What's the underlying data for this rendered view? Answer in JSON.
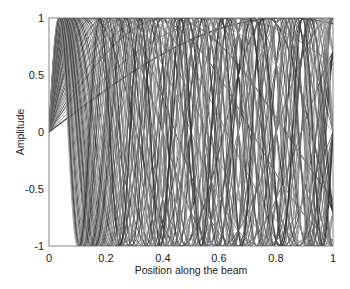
{
  "chart_data": {
    "type": "line",
    "title": "",
    "xlabel": "Position along the beam",
    "ylabel": "Amplitude",
    "xlim": [
      0,
      1
    ],
    "ylim": [
      -1,
      1
    ],
    "xticks": [
      "0",
      "0.2",
      "0.4",
      "0.6",
      "0.8",
      "1"
    ],
    "yticks": [
      "1",
      "0.5",
      "0",
      "-0.5",
      "-1"
    ],
    "grid": false,
    "legend": null,
    "series_form": "y = sin(w * x)",
    "frequencies": [
      1.2,
      1.6,
      2.0,
      2.4,
      2.8,
      3.2,
      3.6,
      4.0,
      4.5,
      5.0,
      5.5,
      6.0,
      6.5,
      7.0,
      7.5,
      8.0,
      8.5,
      9.0,
      9.5,
      10.0,
      10.5,
      11.0,
      11.5,
      12.0,
      12.5,
      13.0,
      13.5,
      14.0,
      14.5,
      15.0,
      15.5,
      16.0,
      16.5,
      17.0,
      17.5,
      18.0,
      18.5,
      19.0,
      19.5,
      20.0,
      20.5,
      21.0,
      22.0,
      23.0,
      24.0,
      25.0,
      26.0,
      27.0,
      28.0,
      29.0,
      30.0
    ]
  },
  "colors": {
    "line_dark": "#333333",
    "line_mid": "#666666",
    "line_light": "#999999",
    "axis": "#444444"
  }
}
